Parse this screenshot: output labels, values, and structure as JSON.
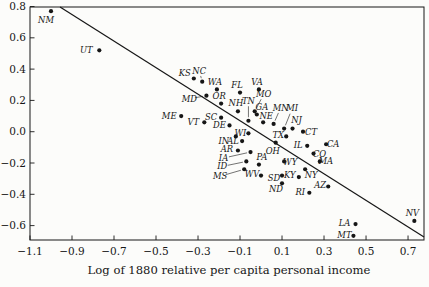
{
  "chart_data": {
    "type": "scatter",
    "title": "",
    "xlabel": "Log of 1880 relative per capita personal income",
    "ylabel": "",
    "xlim": [
      -1.1,
      0.776
    ],
    "ylim": [
      -0.692,
      0.797
    ],
    "grid": false,
    "marker_color": "#161616",
    "x_ticks": {
      "values": [
        -1.1,
        -0.9,
        -0.7,
        -0.5,
        -0.3,
        -0.1,
        0.1,
        0.3,
        0.5,
        0.7
      ],
      "labels": [
        "−1.1",
        "−0.9",
        "−0.7",
        "−0.5",
        "−0.3",
        "−0.1",
        "0.1",
        "0.3",
        "0.5",
        "0.7"
      ]
    },
    "y_ticks": {
      "values": [
        0.8,
        0.6,
        0.4,
        0.2,
        0.0,
        -0.2,
        -0.4,
        -0.6
      ],
      "labels": [
        "0.8",
        "0.6",
        "0.4",
        "0.2",
        "0.0",
        "−0.2",
        "−0.4",
        "−0.6"
      ]
    },
    "trend_line": {
      "x1": -0.957,
      "y1": 0.797,
      "x2": 0.776,
      "y2": -0.673
    },
    "points": [
      {
        "state": "NM",
        "x": -1.0,
        "y": 0.77,
        "dx": -5,
        "dy": 9,
        "leader": false
      },
      {
        "state": "UT",
        "x": -0.77,
        "y": 0.52,
        "dx": -13,
        "dy": 0,
        "leader": false
      },
      {
        "state": "KS",
        "x": -0.32,
        "y": 0.34,
        "dx": -9,
        "dy": -5,
        "leader": false
      },
      {
        "state": "NC",
        "x": -0.28,
        "y": 0.32,
        "dx": -3,
        "dy": -11,
        "leader": true
      },
      {
        "state": "WA",
        "x": -0.21,
        "y": 0.27,
        "dx": -2,
        "dy": -7,
        "leader": false
      },
      {
        "state": "MD",
        "x": -0.26,
        "y": 0.23,
        "dx": -17,
        "dy": 3,
        "leader": true
      },
      {
        "state": "OR",
        "x": -0.19,
        "y": 0.18,
        "dx": -2,
        "dy": -7,
        "leader": false
      },
      {
        "state": "FL",
        "x": -0.1,
        "y": 0.25,
        "dx": -3,
        "dy": -7,
        "leader": false
      },
      {
        "state": "VA",
        "x": -0.01,
        "y": 0.27,
        "dx": -2,
        "dy": -7,
        "leader": false
      },
      {
        "state": "ME",
        "x": -0.38,
        "y": 0.1,
        "dx": -12,
        "dy": 0,
        "leader": false
      },
      {
        "state": "SC",
        "x": -0.19,
        "y": 0.09,
        "dx": -10,
        "dy": -1,
        "leader": false
      },
      {
        "state": "VT",
        "x": -0.27,
        "y": 0.06,
        "dx": -11,
        "dy": 0,
        "leader": false
      },
      {
        "state": "DE",
        "x": -0.15,
        "y": 0.04,
        "dx": -10,
        "dy": 0,
        "leader": false
      },
      {
        "state": "NH",
        "x": -0.11,
        "y": 0.13,
        "dx": -2,
        "dy": -8,
        "leader": false
      },
      {
        "state": "TN",
        "x": -0.06,
        "y": 0.07,
        "dx": 0,
        "dy": -20,
        "leader": true
      },
      {
        "state": "MO",
        "x": -0.03,
        "y": 0.13,
        "dx": 9,
        "dy": -17,
        "leader": true
      },
      {
        "state": "GA",
        "x": -0.02,
        "y": 0.11,
        "dx": 5,
        "dy": -7,
        "leader": false
      },
      {
        "state": "NE",
        "x": 0.01,
        "y": 0.06,
        "dx": 3,
        "dy": -6,
        "leader": false
      },
      {
        "state": "MN",
        "x": 0.06,
        "y": 0.05,
        "dx": 7,
        "dy": -16,
        "leader": true
      },
      {
        "state": "MI",
        "x": 0.11,
        "y": 0.02,
        "dx": 8,
        "dy": -20,
        "leader": true
      },
      {
        "state": "NJ",
        "x": 0.15,
        "y": 0.02,
        "dx": 4,
        "dy": -8,
        "leader": false
      },
      {
        "state": "CT",
        "x": 0.2,
        "y": 0.0,
        "dx": 8,
        "dy": 0,
        "leader": false
      },
      {
        "state": "WI",
        "x": -0.06,
        "y": -0.01,
        "dx": -8,
        "dy": 0,
        "leader": false
      },
      {
        "state": "IN",
        "x": -0.12,
        "y": -0.03,
        "dx": -12,
        "dy": 5,
        "leader": false
      },
      {
        "state": "AL",
        "x": -0.09,
        "y": -0.06,
        "dx": -9,
        "dy": 0,
        "leader": false
      },
      {
        "state": "TX",
        "x": 0.12,
        "y": -0.03,
        "dx": -8,
        "dy": -1,
        "leader": false
      },
      {
        "state": "OH",
        "x": 0.07,
        "y": -0.07,
        "dx": -3,
        "dy": 8,
        "leader": false
      },
      {
        "state": "AR",
        "x": -0.11,
        "y": -0.12,
        "dx": -11,
        "dy": -1,
        "leader": false
      },
      {
        "state": "IA",
        "x": -0.05,
        "y": -0.13,
        "dx": -27,
        "dy": 6,
        "leader": true
      },
      {
        "state": "PA",
        "x": -0.01,
        "y": -0.21,
        "dx": 3,
        "dy": -7,
        "leader": false
      },
      {
        "state": "ID",
        "x": -0.07,
        "y": -0.19,
        "dx": -24,
        "dy": 5,
        "leader": true
      },
      {
        "state": "MS",
        "x": -0.08,
        "y": -0.24,
        "dx": -24,
        "dy": 7,
        "leader": true
      },
      {
        "state": "WV",
        "x": 0.0,
        "y": -0.28,
        "dx": -9,
        "dy": -1,
        "leader": false
      },
      {
        "state": "SD",
        "x": 0.1,
        "y": -0.28,
        "dx": -8,
        "dy": 3,
        "leader": false
      },
      {
        "state": "ND",
        "x": 0.1,
        "y": -0.33,
        "dx": -6,
        "dy": 6,
        "leader": false
      },
      {
        "state": "RI",
        "x": 0.23,
        "y": -0.39,
        "dx": -9,
        "dy": -1,
        "leader": false
      },
      {
        "state": "KY",
        "x": 0.18,
        "y": -0.29,
        "dx": -9,
        "dy": -2,
        "leader": false
      },
      {
        "state": "NY",
        "x": 0.21,
        "y": -0.24,
        "dx": 6,
        "dy": 6,
        "leader": false
      },
      {
        "state": "WY",
        "x": 0.11,
        "y": -0.19,
        "dx": 6,
        "dy": 1,
        "leader": false
      },
      {
        "state": "AZ",
        "x": 0.32,
        "y": -0.35,
        "dx": -8,
        "dy": -1,
        "leader": false
      },
      {
        "state": "IL",
        "x": 0.22,
        "y": -0.09,
        "dx": -9,
        "dy": -1,
        "leader": false
      },
      {
        "state": "CO",
        "x": 0.25,
        "y": -0.14,
        "dx": 6,
        "dy": 0,
        "leader": false
      },
      {
        "state": "MA",
        "x": 0.28,
        "y": -0.19,
        "dx": 6,
        "dy": 0,
        "leader": false
      },
      {
        "state": "CA",
        "x": 0.31,
        "y": -0.08,
        "dx": 7,
        "dy": 0,
        "leader": false
      },
      {
        "state": "NV",
        "x": 0.73,
        "y": -0.57,
        "dx": -2,
        "dy": -8,
        "leader": false
      },
      {
        "state": "LA",
        "x": 0.45,
        "y": -0.59,
        "dx": -11,
        "dy": -1,
        "leader": false
      },
      {
        "state": "MT",
        "x": 0.44,
        "y": -0.665,
        "dx": -9,
        "dy": -1,
        "leader": false
      }
    ]
  },
  "layout": {
    "plot_box": {
      "left": 30,
      "top": 7,
      "right": 424,
      "bottom": 240
    },
    "ink_color": "#161616",
    "paper_color": "#fcfcfa"
  }
}
